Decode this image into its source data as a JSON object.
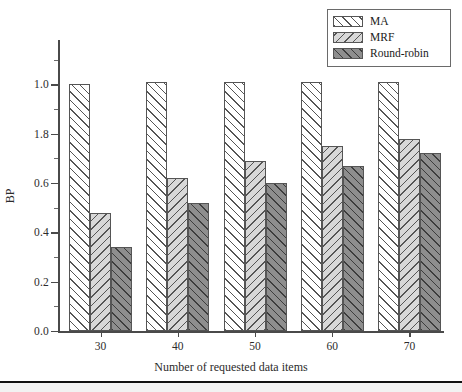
{
  "chart_data": {
    "type": "bar",
    "title": "",
    "xlabel": "Number of requested data items",
    "ylabel": "BP",
    "categories": [
      "30",
      "40",
      "50",
      "60",
      "70"
    ],
    "series": [
      {
        "name": "MA",
        "values": [
          1.0,
          1.01,
          1.01,
          1.01,
          1.01
        ],
        "fill": "#ffffff",
        "hatch": "/",
        "edge": "#555555"
      },
      {
        "name": "MRF",
        "values": [
          0.48,
          0.62,
          0.69,
          0.75,
          0.78
        ],
        "fill": "#d8d8d8",
        "hatch": "\\",
        "edge": "#555555"
      },
      {
        "name": "Round-robin",
        "values": [
          0.34,
          0.52,
          0.6,
          0.67,
          0.72
        ],
        "fill": "#8e8e8e",
        "hatch": "/",
        "edge": "#3d3d3d"
      }
    ],
    "ylim": [
      0.0,
      1.18
    ],
    "ytick_values": [
      0.0,
      0.2,
      0.4,
      0.6,
      0.8,
      1.0
    ],
    "ytick_labels": [
      "0.0",
      "0.2",
      "0.4",
      "0.6",
      "1.8",
      "1.0"
    ],
    "y_minor_ticks": [
      0.1,
      0.3,
      0.5,
      0.7,
      0.9,
      1.1
    ],
    "grid": false,
    "legend_position": "top-right",
    "legend_entries": [
      "MA",
      "MRF",
      "Round-robin"
    ]
  },
  "legend": {
    "items": [
      {
        "label": "MA"
      },
      {
        "label": "MRF"
      },
      {
        "label": "Round-robin"
      }
    ]
  },
  "axes": {
    "y_title": "BP",
    "x_title": "Number of requested data items",
    "y_labels": [
      "1.0",
      "1.8",
      "0.6",
      "0.4",
      "0.2",
      "0.0"
    ],
    "x_labels": [
      "30",
      "40",
      "50",
      "60",
      "70"
    ]
  }
}
